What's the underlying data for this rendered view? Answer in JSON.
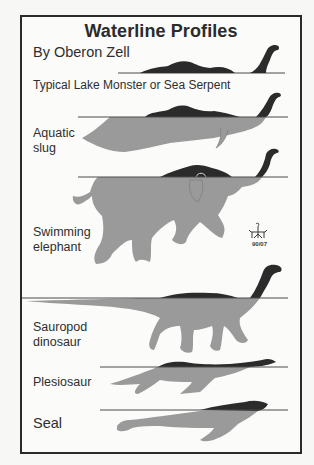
{
  "figure": {
    "title": "Waterline Profiles",
    "author": "By Oberon Zell",
    "signature_date": "90/07",
    "colors": {
      "above_water": "#2b2b2b",
      "below_water": "#9a9a9a",
      "waterline": "#4a4a4a",
      "border": "#2a2a2a",
      "background": "#fbfbf9"
    }
  },
  "profiles": [
    {
      "id": "serpent",
      "label": "Typical Lake Monster or Sea Serpent"
    },
    {
      "id": "slug",
      "label_line1": "Aquatic",
      "label_line2": "slug"
    },
    {
      "id": "elephant",
      "label_line1": "Swimming",
      "label_line2": "elephant"
    },
    {
      "id": "sauropod",
      "label_line1": "Sauropod",
      "label_line2": "dinosaur"
    },
    {
      "id": "plesiosaur",
      "label": "Plesiosaur"
    },
    {
      "id": "seal",
      "label": "Seal"
    }
  ]
}
